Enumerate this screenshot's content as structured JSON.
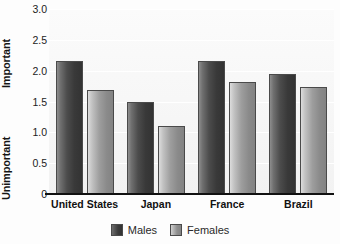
{
  "chart_data": {
    "type": "bar",
    "title": "",
    "xlabel": "",
    "ylabel": "",
    "categories": [
      "United States",
      "Japan",
      "France",
      "Brazil"
    ],
    "series": [
      {
        "name": "Males",
        "values": [
          2.15,
          1.5,
          2.15,
          1.95
        ],
        "color": "#3b3b3b"
      },
      {
        "name": "Females",
        "values": [
          1.68,
          1.1,
          1.82,
          1.73
        ],
        "color": "#8f8f8f"
      }
    ],
    "ylim": [
      0,
      3.0
    ],
    "yticks": [
      "0",
      "0.5",
      "1.0",
      "1.5",
      "2.0",
      "2.5",
      "3.0"
    ],
    "ytick_values": [
      0,
      0.5,
      1.0,
      1.5,
      2.0,
      2.5,
      3.0
    ],
    "axis_top_caption": "Important",
    "axis_bottom_caption": "Unimportant",
    "grid": true,
    "legend_position": "bottom"
  },
  "legend": {
    "items": [
      {
        "label": "Males"
      },
      {
        "label": "Females"
      }
    ]
  }
}
